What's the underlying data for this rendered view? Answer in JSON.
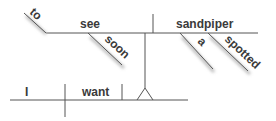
{
  "diagram": {
    "type": "reed-kellogg-sentence-diagram",
    "words": {
      "subject": "I",
      "verb": "want",
      "infinitive_marker": "to",
      "infinitive_verb": "see",
      "adverb": "soon",
      "object": "sandpiper",
      "article": "a",
      "adjective": "spotted"
    },
    "colors": {
      "line": "#555555",
      "text": "#3a3a3a",
      "background": "#ffffff"
    }
  }
}
